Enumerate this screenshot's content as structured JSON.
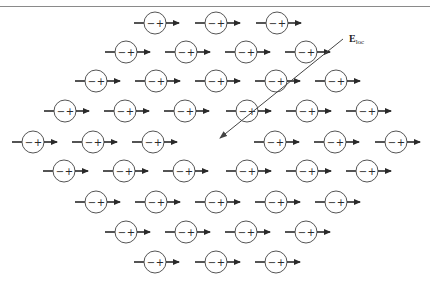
{
  "figure": {
    "field_label": {
      "main": "E",
      "subscript": "loc"
    },
    "dipole": {
      "minus": "−",
      "plus": "+"
    },
    "colors": {
      "ink": "#2a2a2a",
      "circle": "#555555",
      "field_line": "#444444",
      "rule": "#8a8a8a"
    },
    "field_arrow": {
      "x1": 343,
      "y1": 39,
      "x2": 220,
      "y2": 138
    },
    "field_label_pos": {
      "x": 349,
      "y": 33
    },
    "rows": [
      {
        "y": 23,
        "x": [
          155,
          216,
          277
        ]
      },
      {
        "y": 52,
        "x": [
          126,
          186,
          246,
          306
        ]
      },
      {
        "y": 81,
        "x": [
          96,
          156,
          216,
          276,
          336
        ]
      },
      {
        "y": 111,
        "x": [
          65,
          125,
          185,
          247,
          307,
          367
        ]
      },
      {
        "y": 142,
        "x": [
          33,
          93,
          153,
          275,
          335,
          396
        ]
      },
      {
        "y": 171,
        "x": [
          64,
          124,
          184,
          247,
          307,
          367
        ]
      },
      {
        "y": 202,
        "x": [
          96,
          156,
          216,
          276,
          336
        ]
      },
      {
        "y": 232,
        "x": [
          126,
          186,
          246,
          306
        ]
      },
      {
        "y": 262,
        "x": [
          155,
          216,
          276
        ]
      }
    ]
  }
}
